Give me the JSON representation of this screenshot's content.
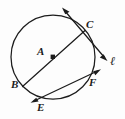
{
  "figure": {
    "type": "geometry-diagram",
    "background_color": "#fdfdfd",
    "stroke_color": "#1c1c1c",
    "circle": {
      "center_label": "A",
      "center_x": 53,
      "center_y": 57,
      "radius": 42,
      "center_marker": "square-dot"
    },
    "labels": [
      {
        "id": "A",
        "text": "A",
        "x": 38,
        "y": 50,
        "style": "italic"
      },
      {
        "id": "B",
        "text": "B",
        "x": 12,
        "y": 84,
        "style": "italic"
      },
      {
        "id": "C",
        "text": "C",
        "x": 87,
        "y": 22,
        "style": "italic"
      },
      {
        "id": "E",
        "text": "E",
        "x": 38,
        "y": 103,
        "style": "italic"
      },
      {
        "id": "F",
        "text": "F",
        "x": 90,
        "y": 79,
        "style": "italic"
      },
      {
        "id": "l",
        "text": "ℓ",
        "x": 111,
        "y": 57,
        "style": "script"
      }
    ],
    "points": {
      "A": {
        "label": "A",
        "x": 53,
        "y": 57
      },
      "B": {
        "label": "B",
        "x": 23,
        "y": 86
      },
      "C": {
        "label": "C",
        "x": 84,
        "y": 31
      },
      "E": {
        "label": "E",
        "x": 34,
        "y": 100
      },
      "F": {
        "label": "F",
        "x": 92,
        "y": 74
      }
    },
    "segments": [
      {
        "name": "diameter-BC",
        "from": "B",
        "to": "C",
        "x1": 23,
        "y1": 86,
        "x2": 84,
        "y2": 31,
        "arrowheads": "none"
      },
      {
        "name": "tangent-line-l",
        "through": "C",
        "x1": 63,
        "y1": 9,
        "x2": 106,
        "y2": 59,
        "arrowheads": "both",
        "label": "ℓ"
      },
      {
        "name": "secant-line-EF",
        "through": "E and F",
        "x1": 32,
        "y1": 102,
        "x2": 99,
        "y2": 70,
        "arrowheads": "both"
      }
    ],
    "icons": [
      {
        "name": "arrowhead-up-left-icon",
        "x": 63,
        "y": 9
      },
      {
        "name": "arrowhead-down-right-icon",
        "x": 106,
        "y": 59
      },
      {
        "name": "arrowhead-down-left-icon",
        "x": 32,
        "y": 102
      },
      {
        "name": "arrowhead-up-right-icon",
        "x": 99,
        "y": 70
      },
      {
        "name": "center-dot-icon",
        "x": 53,
        "y": 57
      }
    ]
  }
}
